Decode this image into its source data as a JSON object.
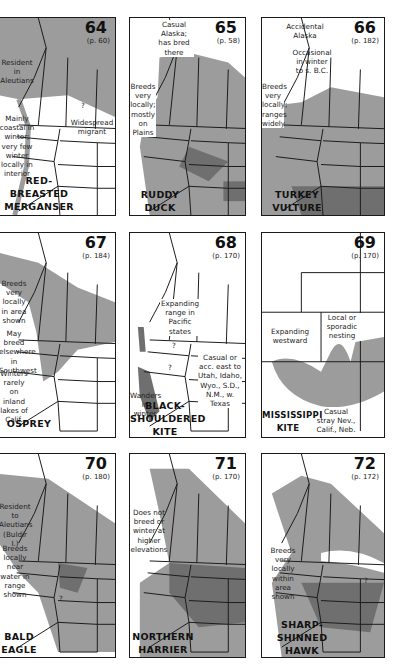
{
  "colors": {
    "range_light": "#9c9c9c",
    "range_dark": "#6f6f6f",
    "border": "#1a1a1a",
    "background": "#ffffff"
  },
  "maps": [
    {
      "number": "64",
      "page": "(p. 60)",
      "name": [
        "RED-",
        "BREASTED",
        "MERGANSER"
      ],
      "notes": [
        "Resident in Aleutians",
        "Mainly coastal in winter; very few winter locally in interior",
        "Widespread migrant",
        "?"
      ]
    },
    {
      "number": "65",
      "page": "(p. 58)",
      "name": [
        "RUDDY",
        "DUCK"
      ],
      "notes": [
        "Casual Alaska; has bred there",
        "Breeds very locally; mostly on Plains"
      ]
    },
    {
      "number": "66",
      "page": "(p. 182)",
      "name": [
        "TURKEY",
        "VULTURE"
      ],
      "notes": [
        "Accidental Alaska",
        "Occasional in winter to s. B.C.",
        "Breeds very locally; ranges widely"
      ]
    },
    {
      "number": "67",
      "page": "(p. 184)",
      "name": [
        "OSPREY"
      ],
      "notes": [
        "Breeds very locally in area shown",
        "May breed elsewhere in Southwest",
        "Winters rarely on inland lakes of Calif."
      ]
    },
    {
      "number": "68",
      "page": "(p. 170)",
      "name": [
        "BLACK-",
        "SHOULDERED",
        "KITE"
      ],
      "notes": [
        "Expanding range in Pacific states",
        "Casual or acc. east to Utah, Idaho, Wyo., S.D., N.M., w. Texas",
        "Wanders in winter",
        "?",
        "?"
      ]
    },
    {
      "number": "69",
      "page": "(p. 170)",
      "name": [
        "MISSISSIPPI",
        "KITE"
      ],
      "notes": [
        "Expanding westward",
        "Local or sporadic nesting",
        "Casual stray Nev., Calif., Neb."
      ]
    },
    {
      "number": "70",
      "page": "(p. 180)",
      "name": [
        "BALD",
        "EAGLE"
      ],
      "notes": [
        "Resident to Aleutians (Buldir I.)",
        "Breeds locally near water in range shown",
        "?"
      ]
    },
    {
      "number": "71",
      "page": "(p. 170)",
      "name": [
        "NORTHERN",
        "HARRIER"
      ],
      "notes": [
        "Does not breed or winter at higher elevations"
      ]
    },
    {
      "number": "72",
      "page": "(p. 172)",
      "name": [
        "SHARP-",
        "SHINNED",
        "HAWK"
      ],
      "notes": [
        "Breeds very locally within area shown",
        "?"
      ]
    }
  ]
}
